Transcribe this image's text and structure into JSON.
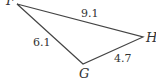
{
  "diagram": {
    "type": "triangle",
    "stroke_color": "#444444",
    "vertices": [
      {
        "label": "F",
        "x": 17,
        "y": 4
      },
      {
        "label": "G",
        "x": 83,
        "y": 64
      },
      {
        "label": "H",
        "x": 143,
        "y": 37
      }
    ],
    "sides": [
      {
        "from": "F",
        "to": "H",
        "length": "9.1"
      },
      {
        "from": "F",
        "to": "G",
        "length": "6.1"
      },
      {
        "from": "G",
        "to": "H",
        "length": "4.7"
      }
    ]
  }
}
